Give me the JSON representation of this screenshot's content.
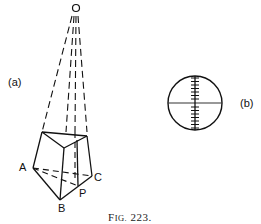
{
  "figure": {
    "caption_prefix": "F",
    "caption_smallcaps": "IG.",
    "caption_number": "223.",
    "panel_a_label": "(a)",
    "panel_b_label": "(b)"
  },
  "prism": {
    "apex_label": "O",
    "vertex_labels": {
      "A": "A",
      "B": "B",
      "C": "C",
      "P": "P"
    }
  },
  "reticle": {
    "shape": "circle-with-crosshair",
    "vertical_ticks": 14
  },
  "colors": {
    "ink": "#111111",
    "background": "#ffffff"
  }
}
